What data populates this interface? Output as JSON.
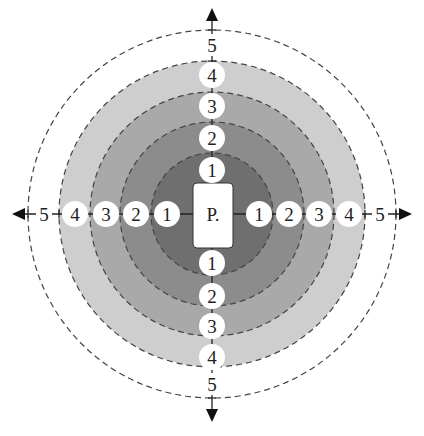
{
  "diagram": {
    "center_label": "P.",
    "rings": [
      {
        "level": 1,
        "radius": 61,
        "color": "#6f6f6f"
      },
      {
        "level": 2,
        "radius": 92,
        "color": "#8c8c8c"
      },
      {
        "level": 3,
        "radius": 122,
        "color": "#a9a9a9"
      },
      {
        "level": 4,
        "radius": 153,
        "color": "#cecece"
      },
      {
        "level": 5,
        "radius": 184,
        "color": "#ffffff"
      }
    ],
    "labels": {
      "up": [
        "1",
        "2",
        "3",
        "4",
        "5"
      ],
      "down": [
        "1",
        "2",
        "3",
        "4",
        "5"
      ],
      "left": [
        "1",
        "2",
        "3",
        "4",
        "5"
      ],
      "right": [
        "1",
        "2",
        "3",
        "4",
        "5"
      ]
    },
    "arrows": [
      "up",
      "down",
      "left",
      "right"
    ]
  }
}
